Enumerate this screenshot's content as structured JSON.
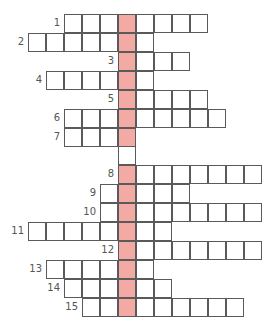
{
  "puzzle": {
    "type": "crossword",
    "highlight_color": "#f3aaa5",
    "line_color": "#5a5a5a",
    "highlight_column_x": 118,
    "extra_blank_cells": [
      {
        "x": 118,
        "y": 146
      }
    ],
    "rows": [
      {
        "number": "1",
        "y": 14,
        "start_x": 64,
        "cells": 8
      },
      {
        "number": "2",
        "y": 33,
        "start_x": 28,
        "cells": 7
      },
      {
        "number": "3",
        "y": 52,
        "start_x": 118,
        "cells": 4
      },
      {
        "number": "4",
        "y": 71,
        "start_x": 46,
        "cells": 6
      },
      {
        "number": "5",
        "y": 90,
        "start_x": 118,
        "cells": 5
      },
      {
        "number": "6",
        "y": 109,
        "start_x": 64,
        "cells": 9
      },
      {
        "number": "7",
        "y": 128,
        "start_x": 64,
        "cells": 4
      },
      {
        "number": "8",
        "y": 165,
        "start_x": 118,
        "cells": 8
      },
      {
        "number": "9",
        "y": 184,
        "start_x": 100,
        "cells": 5
      },
      {
        "number": "10",
        "y": 203,
        "start_x": 100,
        "cells": 9
      },
      {
        "number": "11",
        "y": 222,
        "start_x": 28,
        "cells": 8
      },
      {
        "number": "12",
        "y": 241,
        "start_x": 118,
        "cells": 8
      },
      {
        "number": "13",
        "y": 260,
        "start_x": 46,
        "cells": 6
      },
      {
        "number": "14",
        "y": 279,
        "start_x": 64,
        "cells": 6
      },
      {
        "number": "15",
        "y": 298,
        "start_x": 82,
        "cells": 9
      }
    ]
  }
}
